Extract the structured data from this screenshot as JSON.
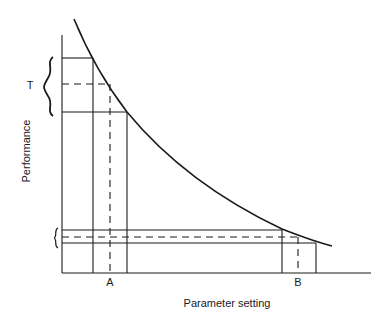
{
  "diagram": {
    "type": "performance-vs-parameter",
    "y_axis_label": "Performance",
    "x_axis_label": "Parameter setting",
    "markers": {
      "A": "A",
      "B": "B",
      "T": "T"
    },
    "colors": {
      "line": "#1a1a1a",
      "background": "#ffffff"
    }
  }
}
